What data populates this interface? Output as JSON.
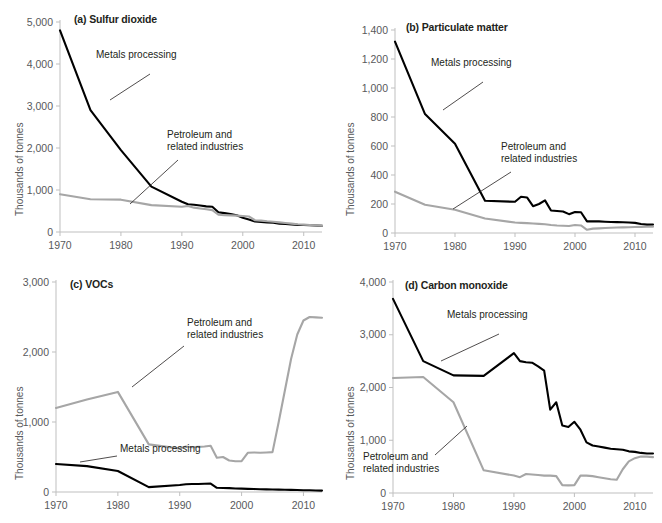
{
  "figure": {
    "ylabel": "Thousands of tonnes",
    "series_colors": {
      "metals": "#000000",
      "petroleum": "#a6a6a6"
    },
    "legend_metals": "Metals processing",
    "legend_petroleum_line1": "Petroleum and",
    "legend_petroleum_line2": "related industries"
  },
  "chart_data": [
    {
      "type": "line",
      "panel": "a",
      "title": "(a) Sulfur dioxide",
      "xlabel": "",
      "ylabel": "Thousands of tonnes",
      "xlim": [
        1970,
        2013
      ],
      "ylim": [
        0,
        5000
      ],
      "yticks": [
        0,
        1000,
        2000,
        3000,
        4000,
        5000
      ],
      "yticklabels": [
        "0",
        "1,000",
        "2,000",
        "3,000",
        "4,000",
        "5,000"
      ],
      "xticks": [
        1970,
        1980,
        1990,
        2000,
        2010
      ],
      "xticklabels": [
        "1970",
        "1980",
        "1990",
        "2000",
        "2010"
      ],
      "grid": false,
      "legend_position": "inline-annotation",
      "x": [
        1970,
        1975,
        1980,
        1985,
        1990,
        1991,
        1992,
        1993,
        1994,
        1995,
        1996,
        1997,
        1998,
        1999,
        2000,
        2001,
        2002,
        2003,
        2004,
        2005,
        2006,
        2007,
        2008,
        2009,
        2010,
        2011,
        2012,
        2013
      ],
      "series": [
        {
          "name": "Metals processing",
          "color": "#000000",
          "values": [
            4800,
            2900,
            1950,
            1080,
            720,
            660,
            650,
            630,
            610,
            600,
            470,
            450,
            430,
            400,
            340,
            300,
            250,
            240,
            230,
            220,
            200,
            190,
            180,
            170,
            165,
            160,
            155,
            150
          ]
        },
        {
          "name": "Petroleum and related industries",
          "color": "#a6a6a6",
          "values": [
            900,
            780,
            770,
            640,
            600,
            620,
            580,
            560,
            540,
            520,
            410,
            400,
            395,
            390,
            380,
            370,
            280,
            270,
            255,
            245,
            230,
            215,
            200,
            185,
            175,
            168,
            160,
            152
          ]
        }
      ]
    },
    {
      "type": "line",
      "panel": "b",
      "title": "(b) Particulate matter",
      "xlabel": "",
      "ylabel": "Thousands of tonnes",
      "xlim": [
        1970,
        2013
      ],
      "ylim": [
        0,
        1400
      ],
      "yticks": [
        0,
        200,
        400,
        600,
        800,
        1000,
        1200,
        1400
      ],
      "yticklabels": [
        "0",
        "200",
        "400",
        "600",
        "800",
        "1,000",
        "1,200",
        "1,400"
      ],
      "xticks": [
        1970,
        1980,
        1990,
        2000,
        2010
      ],
      "xticklabels": [
        "1970",
        "1980",
        "1990",
        "2000",
        "2010"
      ],
      "grid": false,
      "legend_position": "inline-annotation",
      "x": [
        1970,
        1975,
        1980,
        1985,
        1990,
        1991,
        1992,
        1993,
        1994,
        1995,
        1996,
        1997,
        1998,
        1999,
        2000,
        2001,
        2002,
        2003,
        2004,
        2005,
        2006,
        2007,
        2008,
        2009,
        2010,
        2011,
        2012,
        2013
      ],
      "series": [
        {
          "name": "Metals processing",
          "color": "#000000",
          "values": [
            1320,
            820,
            615,
            222,
            215,
            250,
            245,
            185,
            200,
            225,
            155,
            152,
            148,
            130,
            145,
            143,
            80,
            80,
            80,
            78,
            76,
            75,
            74,
            72,
            70,
            62,
            58,
            58
          ]
        },
        {
          "name": "Petroleum and related industries",
          "color": "#a6a6a6",
          "values": [
            285,
            195,
            160,
            100,
            72,
            70,
            68,
            65,
            63,
            60,
            55,
            52,
            50,
            48,
            55,
            52,
            22,
            30,
            32,
            34,
            36,
            38,
            39,
            40,
            41,
            42,
            43,
            44
          ]
        }
      ]
    },
    {
      "type": "line",
      "panel": "c",
      "title": "(c) VOCs",
      "xlabel": "",
      "ylabel": "Thousands of tonnes",
      "xlim": [
        1970,
        2013
      ],
      "ylim": [
        0,
        3000
      ],
      "yticks": [
        0,
        1000,
        2000,
        3000
      ],
      "yticklabels": [
        "0",
        "1,000",
        "2,000",
        "3,000"
      ],
      "xticks": [
        1970,
        1980,
        1990,
        2000,
        2010
      ],
      "xticklabels": [
        "1970",
        "1980",
        "1990",
        "2000",
        "2010"
      ],
      "grid": false,
      "legend_position": "inline-annotation",
      "x": [
        1970,
        1975,
        1980,
        1985,
        1990,
        1991,
        1992,
        1993,
        1994,
        1995,
        1996,
        1997,
        1998,
        1999,
        2000,
        2001,
        2002,
        2003,
        2004,
        2005,
        2006,
        2007,
        2008,
        2009,
        2010,
        2011,
        2012,
        2013
      ],
      "series": [
        {
          "name": "Petroleum and related industries",
          "color": "#a6a6a6",
          "values": [
            1200,
            1320,
            1430,
            680,
            620,
            650,
            640,
            645,
            650,
            660,
            490,
            500,
            450,
            440,
            440,
            560,
            565,
            560,
            565,
            570,
            1000,
            1450,
            1900,
            2250,
            2450,
            2500,
            2495,
            2490
          ]
        },
        {
          "name": "Metals processing",
          "color": "#000000",
          "values": [
            400,
            370,
            300,
            70,
            100,
            110,
            115,
            115,
            118,
            120,
            60,
            58,
            56,
            50,
            48,
            45,
            42,
            40,
            38,
            36,
            34,
            32,
            30,
            28,
            26,
            24,
            22,
            20
          ]
        }
      ]
    },
    {
      "type": "line",
      "panel": "d",
      "title": "(d) Carbon monoxide",
      "xlabel": "",
      "ylabel": "Thousands of tonnes",
      "xlim": [
        1970,
        2013
      ],
      "ylim": [
        0,
        4000
      ],
      "yticks": [
        0,
        1000,
        2000,
        3000,
        4000
      ],
      "yticklabels": [
        "0",
        "1,000",
        "2,000",
        "3,000",
        "4,000"
      ],
      "xticks": [
        1970,
        1980,
        1990,
        2000,
        2010
      ],
      "xticklabels": [
        "1970",
        "1980",
        "1990",
        "2000",
        "2010"
      ],
      "grid": false,
      "legend_position": "inline-annotation",
      "x": [
        1970,
        1975,
        1980,
        1985,
        1990,
        1991,
        1992,
        1993,
        1994,
        1995,
        1996,
        1997,
        1998,
        1999,
        2000,
        2001,
        2002,
        2003,
        2004,
        2005,
        2006,
        2007,
        2008,
        2009,
        2010,
        2011,
        2012,
        2013
      ],
      "series": [
        {
          "name": "Metals processing",
          "color": "#000000",
          "values": [
            3680,
            2500,
            2230,
            2220,
            2650,
            2500,
            2480,
            2470,
            2400,
            2320,
            1580,
            1720,
            1280,
            1250,
            1350,
            1200,
            960,
            900,
            880,
            860,
            840,
            830,
            820,
            790,
            780,
            760,
            750,
            750
          ]
        },
        {
          "name": "Petroleum and related industries",
          "color": "#a6a6a6",
          "values": [
            2180,
            2200,
            1720,
            430,
            330,
            300,
            360,
            350,
            340,
            330,
            330,
            320,
            150,
            145,
            150,
            330,
            330,
            320,
            300,
            280,
            260,
            250,
            450,
            600,
            660,
            690,
            690,
            680
          ]
        }
      ]
    }
  ]
}
